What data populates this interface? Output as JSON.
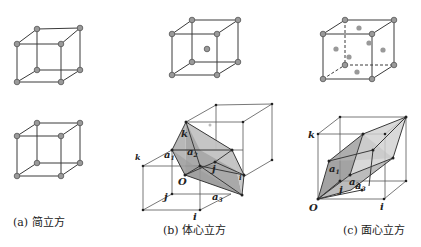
{
  "figure": {
    "panels": [
      {
        "id": "a",
        "caption": "(a) 简立方",
        "type": "simple-cubic"
      },
      {
        "id": "b",
        "caption": "(b) 体心立方",
        "type": "body-centered-cubic",
        "vector_labels": {
          "k": "k",
          "j": "j",
          "i": "i",
          "a1": "a",
          "a2": "a",
          "a3": "a",
          "origin": "O"
        }
      },
      {
        "id": "c",
        "caption": "(c) 面心立方",
        "type": "face-centered-cubic",
        "vector_labels": {
          "k": "k",
          "j": "j",
          "i": "i",
          "a1": "a",
          "a2": "a",
          "a3": "a",
          "origin": "O"
        }
      }
    ],
    "subscripts": {
      "s1": "1",
      "s2": "2",
      "s3": "3"
    },
    "colors": {
      "edge": "#3a3a3a",
      "atom": "#9a9a9a",
      "face_dark": "#8c8c8c",
      "face_light": "#cfcfcf"
    }
  }
}
